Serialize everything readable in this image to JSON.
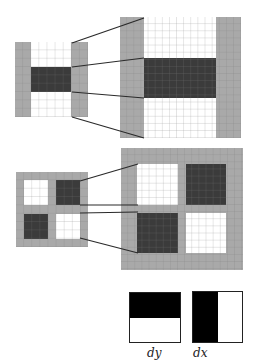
{
  "figure": {
    "colors": {
      "gray": "#a9a9a9",
      "dark": "#3b3b3b",
      "white": "#ffffff",
      "black": "#000000"
    },
    "top": {
      "small_grid": {
        "cells": 9,
        "rows": [
          "white",
          "dark",
          "white"
        ],
        "border_cols": 2
      },
      "large_grid": {
        "cells": 17,
        "description": "magnified view of vertical second-derivative filter"
      }
    },
    "middle": {
      "small_grid": {
        "cells": 9,
        "quadrants": [
          "white",
          "dark",
          "dark",
          "white"
        ]
      },
      "large_grid": {
        "cells": 17,
        "description": "magnified view of mixed second-derivative filter"
      }
    },
    "bottom": {
      "filters": [
        {
          "label": "dy",
          "split": "horizontal",
          "black": "top"
        },
        {
          "label": "dx",
          "split": "vertical",
          "black": "left"
        }
      ]
    }
  }
}
